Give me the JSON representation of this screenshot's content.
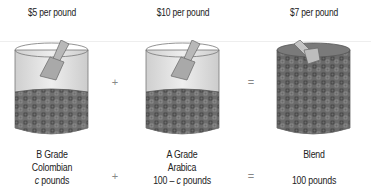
{
  "diagram": {
    "type": "mixture-problem-illustration",
    "containers": [
      {
        "price_label": "$5 per pound",
        "name_line1": "B Grade",
        "name_line2": "Colombian",
        "quantity_var": "c",
        "quantity_suffix": " pounds",
        "fill_color": "#6e6e6e",
        "fill_level": "lower"
      },
      {
        "price_label": "$10 per pound",
        "name_line1": "A Grade",
        "name_line2": "Arabica",
        "quantity_prefix": "100 – ",
        "quantity_var": "c",
        "quantity_suffix": " pounds",
        "fill_color": "#6e6e6e",
        "fill_level": "lower"
      },
      {
        "price_label": "$7 per pound",
        "name_line1": "Blend",
        "quantity_text": "100 pounds",
        "fill_color": "#6a6a6a",
        "fill_level": "full"
      }
    ],
    "operators": {
      "top_plus": "+",
      "top_equals": "=",
      "bottom_plus": "+",
      "bottom_equals": "="
    }
  }
}
